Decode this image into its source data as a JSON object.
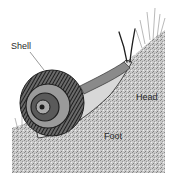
{
  "figure": {
    "labels": {
      "shell": "Shell",
      "head": "Head",
      "foot": "Foot"
    },
    "colors": {
      "background": "#ffffff",
      "ground": "#bdbdbd",
      "ink": "#1e1e1e",
      "label_text": "#2a2a2a"
    }
  }
}
